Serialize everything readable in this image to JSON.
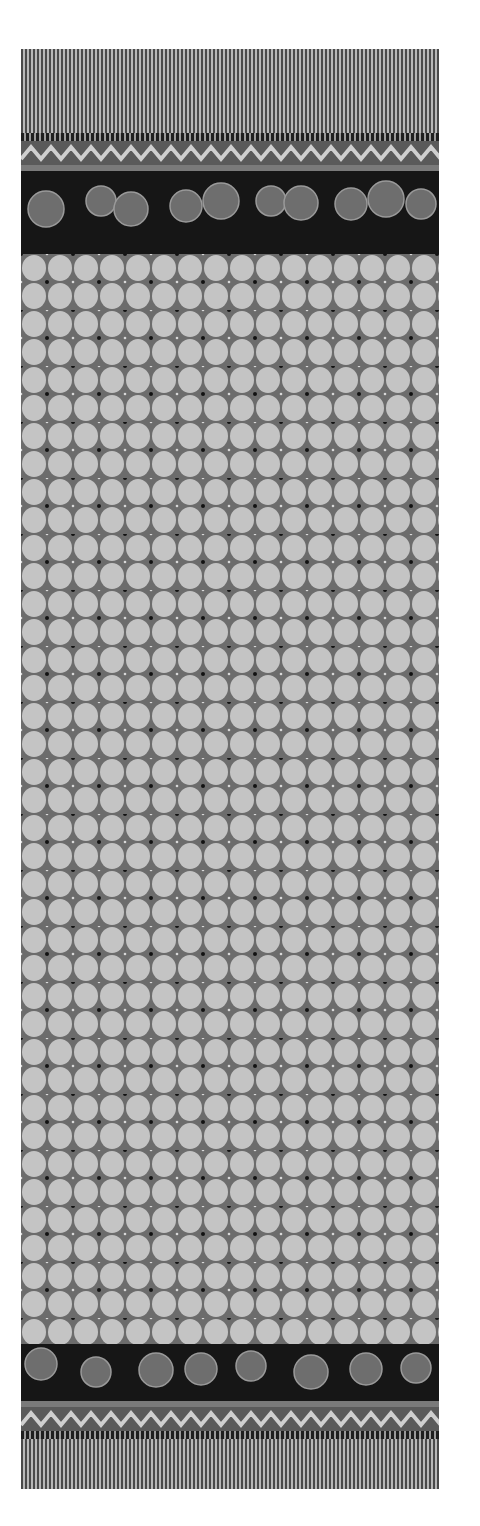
{
  "image": {
    "subject": "Batik textile panel (black and white photograph)",
    "background_color": "#ffffff",
    "regions": [
      {
        "name": "top-stripe-border",
        "pattern": "vertical pinstripes"
      },
      {
        "name": "top-zigzag-band",
        "pattern": "chevron zigzag"
      },
      {
        "name": "top-floral-border",
        "pattern": "flowers and leaves on dark ground"
      },
      {
        "name": "central-field",
        "pattern": "tessellated ovals with four-petal dotted motifs"
      },
      {
        "name": "bottom-floral-border",
        "pattern": "flowers and leaves on dark ground"
      },
      {
        "name": "bottom-zigzag-band",
        "pattern": "chevron zigzag"
      },
      {
        "name": "bottom-stripe-border",
        "pattern": "vertical pinstripes"
      }
    ],
    "colors": {
      "oval": "#c4c4c4",
      "field": "#6c6c6c",
      "dark": "#161616",
      "stripe_dark": "#4a4a4a",
      "stripe_light": "#b8b8b8"
    }
  }
}
